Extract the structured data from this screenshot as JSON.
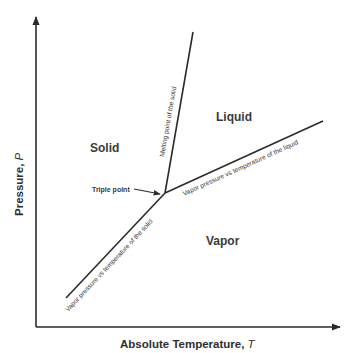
{
  "diagram": {
    "type": "phase-diagram",
    "axes": {
      "x_label": "Absolute Temperature, ",
      "x_symbol": "T",
      "y_label": "Pressure, ",
      "y_symbol": "P"
    },
    "regions": {
      "solid": "Solid",
      "liquid": "Liquid",
      "vapor": "Vapor"
    },
    "curves": {
      "melting": "Melting point of the solid",
      "liquid_vapor": "Vapor pressure vs temperature of the liquid",
      "solid_vapor": "Vapor pressure vs temperature of the solid"
    },
    "annotations": {
      "triple_point": "Triple point"
    },
    "colors": {
      "line": "#2b2b2b",
      "text": "#3a3a3a",
      "background": "#ffffff"
    }
  }
}
